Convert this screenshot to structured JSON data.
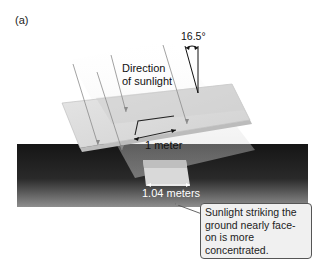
{
  "figure": {
    "panel_label": "(a)",
    "labels": {
      "direction": [
        "Direction",
        "of sunlight"
      ],
      "angle": "16.5°",
      "panel_width": "1 meter",
      "ground_width": "1.04 meters"
    },
    "callout": {
      "text": "Sunlight striking the ground nearly face-on is more concentrated."
    },
    "colors": {
      "ground_dark": "#1a1a1a",
      "ground_light": "#8a8a8a",
      "panel_face": "#dcdcdc",
      "panel_edge": "#bdbdbd",
      "beam": "#c8c8c8",
      "callout_bg": "#f0f0f0"
    }
  }
}
